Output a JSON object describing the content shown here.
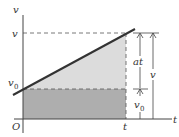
{
  "diagram": {
    "axes": {
      "y_label": "v",
      "x_label": "t",
      "origin_label": "O"
    },
    "tick_labels": {
      "v": "v",
      "v0_main": "v",
      "v0_sub": "0",
      "t": "t"
    },
    "dimension_labels": {
      "at": "at",
      "v": "v",
      "v0_main": "v",
      "v0_sub": "0"
    },
    "regions": [
      {
        "name": "triangle",
        "represents": "½at²",
        "color": "#d9d9d9"
      },
      {
        "name": "rectangle",
        "represents": "v0·t",
        "color": "#a9a9a9"
      }
    ],
    "colors": {
      "line": "#333333",
      "axis": "#444444",
      "dash": "#555555",
      "triangle_fill": "#dcdcdc",
      "rect_fill": "#aeaeae"
    }
  }
}
